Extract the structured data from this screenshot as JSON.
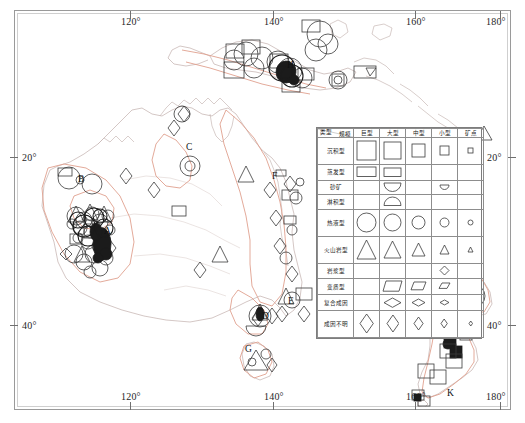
{
  "figure": {
    "type": "thematic-geological-map",
    "region": "Australia, New Guinea and New Zealand",
    "background": "#ffffff",
    "frame_color": "#9a9a9a"
  },
  "axes": {
    "longitude_top": [
      "120°",
      "140°",
      "160°",
      "180°"
    ],
    "longitude_bottom": [
      "120°",
      "140°",
      "160°",
      "180°"
    ],
    "latitude_left": [
      "20°",
      "40°"
    ],
    "latitude_right": [
      "20°",
      "40°"
    ]
  },
  "legend": {
    "corner": {
      "scale_header": "规模",
      "type_header": "类型"
    },
    "columns": [
      "巨型",
      "大型",
      "中型",
      "小型",
      "矿点"
    ],
    "rows": [
      {
        "label": "沉积型",
        "symbols": [
          "square",
          "square",
          "square",
          "square",
          "square"
        ],
        "sizes": [
          19,
          17,
          13,
          9,
          5
        ]
      },
      {
        "label": "蒸发型",
        "symbols": [
          "rect",
          "rect",
          "",
          "",
          ""
        ],
        "sizes": [
          19,
          17,
          0,
          0,
          0
        ]
      },
      {
        "label": "砂矿",
        "symbols": [
          "",
          "semicircle-down",
          "",
          "semicircle-down",
          ""
        ],
        "sizes": [
          0,
          17,
          0,
          9,
          0
        ]
      },
      {
        "label": "淋积型",
        "symbols": [
          "",
          "semicircle-up",
          "",
          "",
          ""
        ],
        "sizes": [
          0,
          17,
          0,
          0,
          0
        ]
      },
      {
        "label": "热液型",
        "symbols": [
          "circle",
          "circle",
          "circle",
          "circle",
          "circle"
        ],
        "sizes": [
          19,
          17,
          13,
          9,
          5
        ]
      },
      {
        "label": "火山岩型",
        "symbols": [
          "triangle",
          "triangle",
          "triangle",
          "triangle",
          "triangle"
        ],
        "sizes": [
          19,
          17,
          13,
          9,
          5
        ]
      },
      {
        "label": "岩浆型",
        "symbols": [
          "",
          "",
          "",
          "diamond",
          ""
        ],
        "sizes": [
          0,
          0,
          0,
          9,
          0
        ]
      },
      {
        "label": "变质型",
        "symbols": [
          "",
          "parallelogram",
          "parallelogram",
          "parallelogram",
          ""
        ],
        "sizes": [
          0,
          17,
          13,
          9,
          0
        ]
      },
      {
        "label": "复合成因",
        "symbols": [
          "",
          "lens",
          "lens",
          "lens",
          ""
        ],
        "sizes": [
          0,
          17,
          13,
          9,
          0
        ]
      },
      {
        "label": "成因不明",
        "symbols": [
          "rhombus",
          "rhombus",
          "rhombus",
          "rhombus",
          "rhombus"
        ],
        "sizes": [
          19,
          17,
          13,
          9,
          5
        ]
      }
    ]
  },
  "map_labels": [
    {
      "id": "A",
      "x": 104,
      "y": 233
    },
    {
      "id": "B",
      "x": 78,
      "y": 180
    },
    {
      "id": "C",
      "x": 186,
      "y": 148
    },
    {
      "id": "D",
      "x": 262,
      "y": 317
    },
    {
      "id": "E",
      "x": 288,
      "y": 302
    },
    {
      "id": "F",
      "x": 272,
      "y": 177
    },
    {
      "id": "G",
      "x": 249,
      "y": 350
    },
    {
      "id": "H",
      "x": 287,
      "y": 66
    },
    {
      "id": "I",
      "x": 469,
      "y": 288
    },
    {
      "id": "J",
      "x": 454,
      "y": 322
    },
    {
      "id": "K",
      "x": 447,
      "y": 394
    }
  ],
  "colors": {
    "coastline": "#c9b9b6",
    "province_outline": "#e0a08e",
    "symbol_stroke": "#3a3a3a",
    "cluster_fill": "#1b1b1b",
    "grid": "#8a8a8a",
    "text": "#1f1f1f"
  }
}
